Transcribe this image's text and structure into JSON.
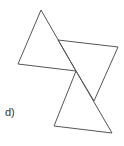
{
  "diagram": {
    "label": "d)",
    "stroke_color": "#555555",
    "shapes": [
      {
        "name": "top-left-triangle",
        "points": "41,10 18,64 76,71"
      },
      {
        "name": "right-quadrilateral",
        "points": "58,40 118,47 94,101 76,71"
      },
      {
        "name": "bottom-triangle",
        "points": "76,71 54,126 112,133"
      }
    ]
  }
}
